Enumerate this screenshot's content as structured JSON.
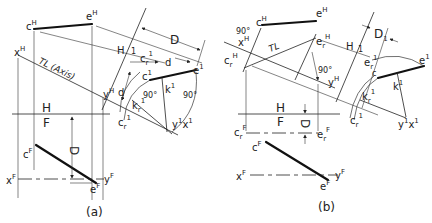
{
  "figure": {
    "panel_a": {
      "caption": "(a)",
      "labels": {
        "cH": "c",
        "cH_sup": "H",
        "eH": "e",
        "eH_sup": "H",
        "xH": "x",
        "xH_sup": "H",
        "TL": "TL (Axis)",
        "H_upper": "H",
        "one_upper": "1",
        "crPrime": "c",
        "crPrime_sub": "r",
        "crPrime_sup": "1",
        "d_upper": "d",
        "cPrime": "c",
        "cPrime_sup": "1",
        "ePrime": "e",
        "ePrime_sup": "1",
        "yH": "y",
        "yH_sup": "H",
        "d_lower": "d",
        "kr": "k",
        "kr_sub": "r",
        "kr_sup": "1",
        "kPrime": "k",
        "kPrime_sup": "1",
        "angle1": "90°",
        "angle2": "90°",
        "D_top": "D",
        "cr_bottom": "c",
        "cr_bottom_sub": "r",
        "cr_bottom_sup": "1",
        "yx1": "y",
        "yx1_sup": "1",
        "yx1_x": "x",
        "yx1_x_sup": "1",
        "H_fold": "H",
        "F_fold": "F",
        "D_front": "D",
        "cF": "c",
        "cF_sup": "F",
        "xF": "x",
        "xF_sup": "F",
        "yF": "y",
        "yF_sup": "F",
        "eF": "e",
        "eF_sup": "F"
      }
    },
    "panel_b": {
      "caption": "(b)",
      "labels": {
        "angle_top": "90°",
        "cH": "c",
        "cH_sup": "H",
        "eH": "e",
        "eH_sup": "H",
        "xH": "x",
        "xH_sup": "H",
        "crH": "c",
        "crH_sub": "r",
        "crH_sup": "H",
        "TL": "TL",
        "erH": "e",
        "erH_sub": "r",
        "erH_sup": "H",
        "angle_mid": "90°",
        "yH": "y",
        "yH_sup": "H",
        "H_upper": "H",
        "one_upper": "1",
        "D1": "D",
        "one_D": "1",
        "er1": "e",
        "er1_sub": "r",
        "er1_sup": "1",
        "c1": "c",
        "e1": "e",
        "e1_sup": "1",
        "kr": "k",
        "kr_sub": "r",
        "kr_sup": "1",
        "k1": "k",
        "k1_sup": "1",
        "cr1": "c",
        "cr1_sub": "r",
        "cr1_sup": "1",
        "yx1": "y",
        "yx1_sup": "1",
        "yx1_x": "x",
        "yx1_x_sup": "1",
        "H_fold": "H",
        "F_fold": "F",
        "D_front": "D",
        "crF": "c",
        "crF_sub": "r",
        "crF_sup": "F",
        "erF": "e",
        "erF_sub": "r",
        "erF_sup": "F",
        "cF": "c",
        "cF_sup": "F",
        "xF": "x",
        "xF_sup": "F",
        "yF": "y",
        "yF_sup": "F",
        "eF": "e",
        "eF_sup": "F"
      }
    }
  }
}
